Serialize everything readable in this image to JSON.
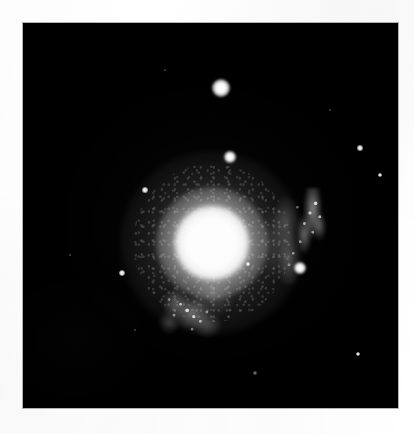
{
  "image": {
    "kind": "astronomical-photographic-plate",
    "background_color": "#ffffff",
    "plate_color": "#000000",
    "plate": {
      "x": 23,
      "y": 23,
      "width": 375,
      "height": 385
    },
    "border_color": "#787878"
  },
  "galaxy": {
    "name": "galaxy",
    "morphology": "bright elliptical / lenticular core with faint tidal spiral arms",
    "core": {
      "cx": 212,
      "cy": 243,
      "bright_radius": 19,
      "halo_radius": 46
    },
    "arms": [
      {
        "name": "north-east tidal arm",
        "position": "upper-right of core",
        "x": 238,
        "y": 165,
        "width": 70,
        "height": 96,
        "brightness": "faint clumpy filament with knots"
      },
      {
        "name": "south-west tidal arm",
        "position": "lower-left of core",
        "x": 133,
        "y": 250,
        "width": 82,
        "height": 78,
        "brightness": "faint clumpy filament with knots"
      }
    ]
  },
  "stars": [
    {
      "id": "star-north-bright",
      "cx": 221,
      "cy": 88,
      "r": 9.0,
      "class": "bright"
    },
    {
      "id": "star-north-mid",
      "cx": 230,
      "cy": 157,
      "r": 6.0,
      "class": "bright"
    },
    {
      "id": "star-east",
      "cx": 300,
      "cy": 268,
      "r": 5.8,
      "class": "bright"
    },
    {
      "id": "star-west",
      "cx": 122,
      "cy": 273,
      "r": 3.4,
      "class": "faint"
    },
    {
      "id": "star-northwest",
      "cx": 145,
      "cy": 190,
      "r": 2.6,
      "class": "faint"
    },
    {
      "id": "star-far-east-upper",
      "cx": 360,
      "cy": 148,
      "r": 2.6,
      "class": "faint"
    },
    {
      "id": "star-far-east-lower",
      "cx": 380,
      "cy": 175,
      "r": 2.4,
      "class": "faint"
    },
    {
      "id": "star-southeast",
      "cx": 358,
      "cy": 354,
      "r": 2.4,
      "class": "faint"
    },
    {
      "id": "star-south",
      "cx": 255,
      "cy": 373,
      "r": 1.6,
      "class": "vfaint"
    },
    {
      "id": "star-southwest-dim",
      "cx": 135,
      "cy": 330,
      "r": 1.3,
      "class": "vfaint"
    },
    {
      "id": "star-west-dim",
      "cx": 70,
      "cy": 255,
      "r": 1.2,
      "class": "vfaint"
    },
    {
      "id": "star-northeast-dim",
      "cx": 330,
      "cy": 110,
      "r": 1.2,
      "class": "vfaint"
    },
    {
      "id": "star-north-dim",
      "cx": 165,
      "cy": 70,
      "r": 1.1,
      "class": "vfaint"
    },
    {
      "id": "star-core-knot",
      "cx": 248,
      "cy": 264,
      "r": 1.6,
      "class": "faint"
    }
  ]
}
